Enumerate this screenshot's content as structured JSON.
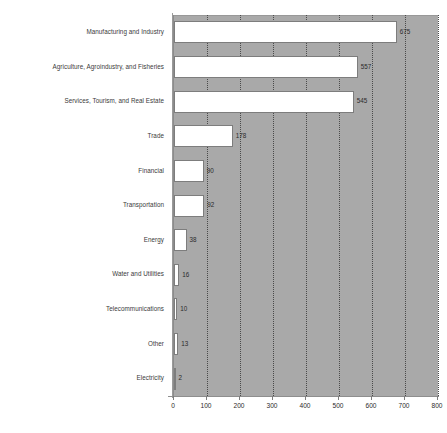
{
  "chart_data": {
    "type": "bar",
    "orientation": "horizontal",
    "title": "",
    "subtitle": "",
    "xlabel": "",
    "ylabel": "",
    "xlim": [
      0,
      800
    ],
    "xticks": [
      0,
      100,
      200,
      300,
      400,
      500,
      600,
      700,
      800
    ],
    "grid": "vertical-dotted",
    "legend": "none",
    "categories": [
      "Manufacturing and Industry",
      "Agriculture, Agroindustry, and Fisheries",
      "Services, Tourism, and Real Estate",
      "Trade",
      "Financial",
      "Transportation",
      "Energy",
      "Water and Utilities",
      "Telecommunications",
      "Other",
      "Electricity"
    ],
    "values": [
      675,
      557,
      545,
      178,
      90,
      92,
      38,
      16,
      10,
      13,
      2
    ],
    "value_labels": [
      "675",
      "557",
      "545",
      "178",
      "90",
      "92",
      "38",
      "16",
      "10",
      "13",
      "2"
    ],
    "colors": {
      "plot_background": "#a9a9a9",
      "bar_fill": "#ffffff",
      "bar_border": "#7d7d7d",
      "gridline": "#4a4a4a",
      "text": "#2b2b2b",
      "label_text": "#3a3a3a",
      "page_background": "#ffffff"
    }
  }
}
